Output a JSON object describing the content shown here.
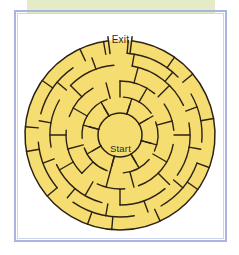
{
  "page": {
    "background_color": "#ffffff",
    "frame_color": "#aab4e0",
    "frame_inner_color": "#ccd3ee",
    "highlight_band_color": "#dfe9bb"
  },
  "maze": {
    "exit_label": "Exit",
    "start_label": "Start",
    "fill_color": "#f6dd72",
    "wall_color": "#2b2214",
    "center": {
      "cx": 103,
      "cy": 122
    },
    "outer_radius": 95,
    "ring_radii": [
      22,
      38,
      54,
      70,
      82,
      95
    ],
    "exit_gap_degrees": [
      -97,
      -83
    ],
    "shape": "circular-concentric",
    "ring_count": 5,
    "sector_count": 24
  },
  "walls": {
    "radial": [
      {
        "ring": 0,
        "angle": 18
      },
      {
        "ring": 0,
        "angle": 60
      },
      {
        "ring": 0,
        "angle": 105
      },
      {
        "ring": 0,
        "angle": 150
      },
      {
        "ring": 0,
        "angle": 195
      },
      {
        "ring": 0,
        "angle": 240
      },
      {
        "ring": 0,
        "angle": 285
      },
      {
        "ring": 0,
        "angle": 330
      },
      {
        "ring": 1,
        "angle": 0
      },
      {
        "ring": 1,
        "angle": 30
      },
      {
        "ring": 1,
        "angle": 75
      },
      {
        "ring": 1,
        "angle": 120
      },
      {
        "ring": 1,
        "angle": 165
      },
      {
        "ring": 1,
        "angle": 195
      },
      {
        "ring": 1,
        "angle": 225
      },
      {
        "ring": 1,
        "angle": 255
      },
      {
        "ring": 1,
        "angle": 300
      },
      {
        "ring": 1,
        "angle": 345
      },
      {
        "ring": 2,
        "angle": 15
      },
      {
        "ring": 2,
        "angle": 45
      },
      {
        "ring": 2,
        "angle": 90
      },
      {
        "ring": 2,
        "angle": 135
      },
      {
        "ring": 2,
        "angle": 180
      },
      {
        "ring": 2,
        "angle": 210
      },
      {
        "ring": 2,
        "angle": 240
      },
      {
        "ring": 2,
        "angle": 270
      },
      {
        "ring": 2,
        "angle": 315
      },
      {
        "ring": 3,
        "angle": 10
      },
      {
        "ring": 3,
        "angle": 40
      },
      {
        "ring": 3,
        "angle": 70
      },
      {
        "ring": 3,
        "angle": 100
      },
      {
        "ring": 3,
        "angle": 130
      },
      {
        "ring": 3,
        "angle": 160
      },
      {
        "ring": 3,
        "angle": 190
      },
      {
        "ring": 3,
        "angle": 220
      },
      {
        "ring": 3,
        "angle": 250
      },
      {
        "ring": 3,
        "angle": 280
      },
      {
        "ring": 3,
        "angle": 310
      },
      {
        "ring": 3,
        "angle": 340
      },
      {
        "ring": 4,
        "angle": 5
      },
      {
        "ring": 4,
        "angle": 35
      },
      {
        "ring": 4,
        "angle": 50
      },
      {
        "ring": 4,
        "angle": 80
      },
      {
        "ring": 4,
        "angle": 110
      },
      {
        "ring": 4,
        "angle": 125
      },
      {
        "ring": 4,
        "angle": 155
      },
      {
        "ring": 4,
        "angle": 185
      },
      {
        "ring": 4,
        "angle": 200
      },
      {
        "ring": 4,
        "angle": 230
      },
      {
        "ring": 4,
        "angle": 260
      },
      {
        "ring": 4,
        "angle": 275
      },
      {
        "ring": 4,
        "angle": 305
      },
      {
        "ring": 4,
        "angle": 335
      },
      {
        "ring": 4,
        "angle": 350
      }
    ],
    "arcs": [
      {
        "radius_index": 1,
        "start": 5,
        "end": 55
      },
      {
        "radius_index": 1,
        "start": 70,
        "end": 115
      },
      {
        "radius_index": 1,
        "start": 130,
        "end": 175
      },
      {
        "radius_index": 1,
        "start": 200,
        "end": 250
      },
      {
        "radius_index": 1,
        "start": 265,
        "end": 340
      },
      {
        "radius_index": 2,
        "start": 0,
        "end": 40
      },
      {
        "radius_index": 2,
        "start": 55,
        "end": 85
      },
      {
        "radius_index": 2,
        "start": 100,
        "end": 160
      },
      {
        "radius_index": 2,
        "start": 175,
        "end": 205
      },
      {
        "radius_index": 2,
        "start": 225,
        "end": 275
      },
      {
        "radius_index": 2,
        "start": 290,
        "end": 330
      },
      {
        "radius_index": 3,
        "start": 10,
        "end": 65
      },
      {
        "radius_index": 3,
        "start": 80,
        "end": 125
      },
      {
        "radius_index": 3,
        "start": 140,
        "end": 180
      },
      {
        "radius_index": 3,
        "start": 195,
        "end": 245
      },
      {
        "radius_index": 3,
        "start": 260,
        "end": 300
      },
      {
        "radius_index": 3,
        "start": 315,
        "end": 355
      },
      {
        "radius_index": 4,
        "start": 5,
        "end": 45
      },
      {
        "radius_index": 4,
        "start": 60,
        "end": 95
      },
      {
        "radius_index": 4,
        "start": 110,
        "end": 150
      },
      {
        "radius_index": 4,
        "start": 170,
        "end": 215
      },
      {
        "radius_index": 4,
        "start": 230,
        "end": 265
      },
      {
        "radius_index": 4,
        "start": 285,
        "end": 325
      }
    ]
  }
}
